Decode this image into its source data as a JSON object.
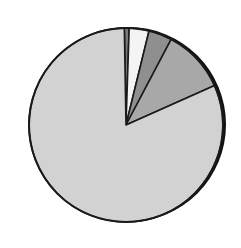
{
  "chart_data": {
    "type": "pie",
    "title": "",
    "labels": [
      "Slice A",
      "Slice B",
      "Slice C",
      "Slice D",
      "Slice E"
    ],
    "values": [
      0.8,
      3.3,
      3.9,
      10.6,
      81.4
    ],
    "colors": [
      "#7a7a7a",
      "#f4f4f4",
      "#8f8f8f",
      "#a8a8a8",
      "#d2d2d2"
    ],
    "start_angle_deg": -1,
    "direction": "clockwise",
    "legend": "none visible",
    "center": [
      126,
      125
    ],
    "radius": 97
  }
}
